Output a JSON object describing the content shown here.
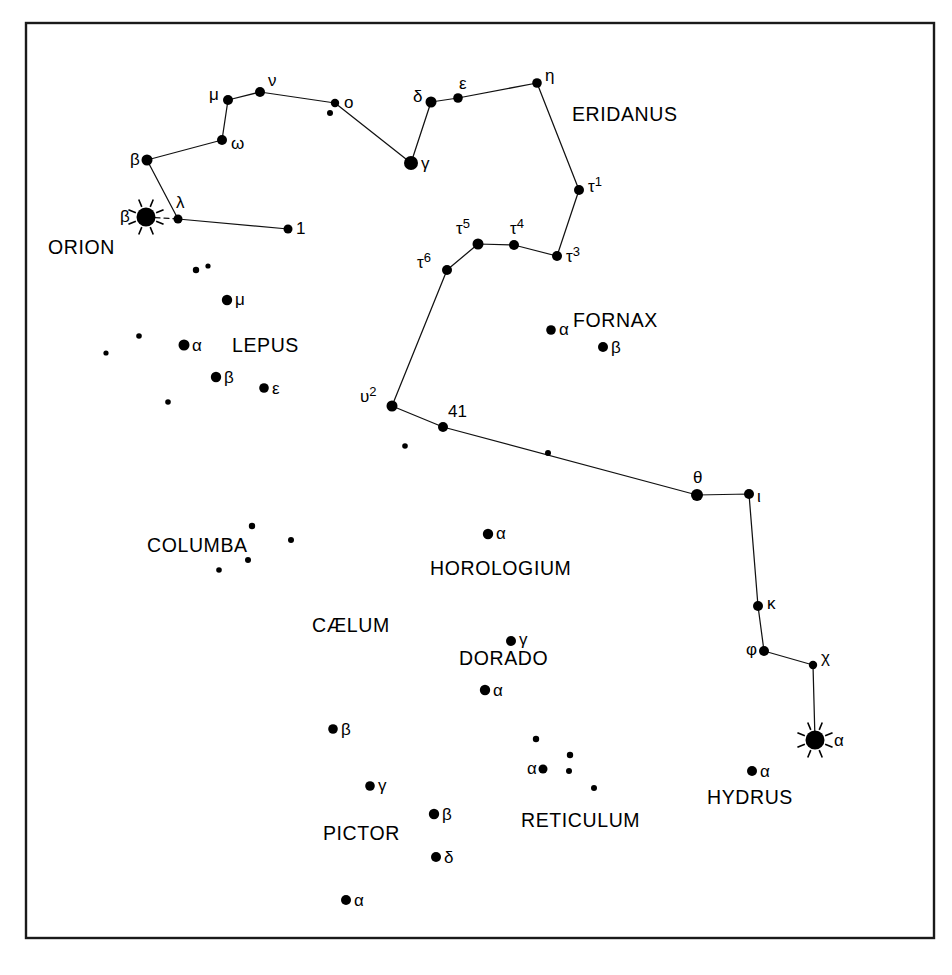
{
  "figure": {
    "background_color": "#ffffff",
    "ink_color": "#000000",
    "frame": {
      "x": 26,
      "y": 23,
      "width": 908,
      "height": 915
    }
  },
  "chart_data": {
    "type": "scatter",
    "xlabel": "",
    "ylabel": "",
    "grid": false,
    "legend": "none",
    "xlim": [
      0,
      952
    ],
    "ylim": [
      0,
      975
    ],
    "constellation_labels": [
      {
        "name": "ERIDANUS",
        "x": 572,
        "y": 121
      },
      {
        "name": "ORION",
        "x": 48,
        "y": 254
      },
      {
        "name": "LEPUS",
        "x": 232,
        "y": 352
      },
      {
        "name": "FORNAX",
        "x": 573,
        "y": 327
      },
      {
        "name": "COLUMBA",
        "x": 147,
        "y": 552
      },
      {
        "name": "HOROLOGIUM",
        "x": 430,
        "y": 575
      },
      {
        "name": "CÆLUM",
        "x": 312,
        "y": 632
      },
      {
        "name": "DORADO",
        "x": 459,
        "y": 665
      },
      {
        "name": "PICTOR",
        "x": 323,
        "y": 840
      },
      {
        "name": "RETICULUM",
        "x": 521,
        "y": 827
      },
      {
        "name": "HYDRUS",
        "x": 707,
        "y": 804
      }
    ],
    "stars": [
      {
        "label": "β",
        "sup": "",
        "x": 147,
        "y": 160,
        "r": 5.5,
        "bright": false,
        "label_dx": -17,
        "label_dy": 5,
        "constellation": "Eridanus"
      },
      {
        "label": "ω",
        "sup": "",
        "x": 222,
        "y": 140,
        "r": 5.0,
        "bright": false,
        "label_dx": 9,
        "label_dy": 9,
        "constellation": "Eridanus"
      },
      {
        "label": "μ",
        "sup": "",
        "x": 228,
        "y": 100,
        "r": 5.0,
        "bright": false,
        "label_dx": -19,
        "label_dy": 0,
        "constellation": "Eridanus"
      },
      {
        "label": "ν",
        "sup": "",
        "x": 260,
        "y": 92,
        "r": 5.0,
        "bright": false,
        "label_dx": 8,
        "label_dy": -6,
        "constellation": "Eridanus"
      },
      {
        "label": "o",
        "sup": "",
        "x": 335,
        "y": 103,
        "r": 4.2,
        "bright": false,
        "label_dx": 9,
        "label_dy": 5,
        "constellation": "Eridanus"
      },
      {
        "label": "",
        "sup": "",
        "x": 330,
        "y": 113,
        "r": 3.0,
        "bright": false,
        "label_dx": 0,
        "label_dy": 0,
        "constellation": "Eridanus"
      },
      {
        "label": "γ",
        "sup": "",
        "x": 411,
        "y": 163,
        "r": 7.0,
        "bright": false,
        "label_dx": 10,
        "label_dy": 6,
        "constellation": "Eridanus"
      },
      {
        "label": "δ",
        "sup": "",
        "x": 431,
        "y": 102,
        "r": 5.5,
        "bright": false,
        "label_dx": -18,
        "label_dy": 0,
        "constellation": "Eridanus"
      },
      {
        "label": "ε",
        "sup": "",
        "x": 458,
        "y": 98,
        "r": 4.8,
        "bright": false,
        "label_dx": 1,
        "label_dy": -9,
        "constellation": "Eridanus"
      },
      {
        "label": "η",
        "sup": "",
        "x": 537,
        "y": 83,
        "r": 4.8,
        "bright": false,
        "label_dx": 8,
        "label_dy": -2,
        "constellation": "Eridanus"
      },
      {
        "label": "τ",
        "sup": "1",
        "x": 579,
        "y": 190,
        "r": 5.0,
        "bright": false,
        "label_dx": 9,
        "label_dy": 2,
        "constellation": "Eridanus"
      },
      {
        "label": "τ",
        "sup": "3",
        "x": 557,
        "y": 256,
        "r": 5.0,
        "bright": false,
        "label_dx": 9,
        "label_dy": 6,
        "constellation": "Eridanus"
      },
      {
        "label": "τ",
        "sup": "4",
        "x": 514,
        "y": 245,
        "r": 5.0,
        "bright": false,
        "label_dx": -4,
        "label_dy": -11,
        "constellation": "Eridanus"
      },
      {
        "label": "τ",
        "sup": "5",
        "x": 478,
        "y": 244,
        "r": 5.5,
        "bright": false,
        "label_dx": -22,
        "label_dy": -10,
        "constellation": "Eridanus"
      },
      {
        "label": "τ",
        "sup": "6",
        "x": 447,
        "y": 270,
        "r": 5.0,
        "bright": false,
        "label_dx": -30,
        "label_dy": -2,
        "constellation": "Eridanus"
      },
      {
        "label": "υ",
        "sup": "2",
        "x": 392,
        "y": 406,
        "r": 5.5,
        "bright": false,
        "label_dx": -32,
        "label_dy": -4,
        "constellation": "Eridanus"
      },
      {
        "label": "41",
        "sup": "",
        "x": 443,
        "y": 427,
        "r": 5.0,
        "bright": false,
        "label_dx": 5,
        "label_dy": -10,
        "constellation": "Eridanus"
      },
      {
        "label": "",
        "sup": "",
        "x": 548,
        "y": 453,
        "r": 3.0,
        "bright": false,
        "label_dx": 0,
        "label_dy": 0,
        "constellation": "Eridanus"
      },
      {
        "label": "θ",
        "sup": "",
        "x": 697,
        "y": 495,
        "r": 6.0,
        "bright": false,
        "label_dx": -4,
        "label_dy": -12,
        "constellation": "Eridanus"
      },
      {
        "label": "ι",
        "sup": "",
        "x": 749,
        "y": 494,
        "r": 5.0,
        "bright": false,
        "label_dx": 8,
        "label_dy": 8,
        "constellation": "Eridanus"
      },
      {
        "label": "κ",
        "sup": "",
        "x": 758,
        "y": 606,
        "r": 5.0,
        "bright": false,
        "label_dx": 9,
        "label_dy": 3,
        "constellation": "Eridanus"
      },
      {
        "label": "φ",
        "sup": "",
        "x": 764,
        "y": 651,
        "r": 5.0,
        "bright": false,
        "label_dx": -18,
        "label_dy": 4,
        "constellation": "Eridanus"
      },
      {
        "label": "χ",
        "sup": "",
        "x": 813,
        "y": 665,
        "r": 4.2,
        "bright": false,
        "label_dx": 8,
        "label_dy": -2,
        "constellation": "Eridanus"
      },
      {
        "label": "α",
        "sup": "",
        "x": 815,
        "y": 740,
        "r": 9.5,
        "bright": true,
        "label_dx": 19,
        "label_dy": 6,
        "constellation": "Eridanus"
      },
      {
        "label": "1",
        "sup": "",
        "x": 288,
        "y": 229,
        "r": 4.5,
        "bright": false,
        "label_dx": 8,
        "label_dy": 5,
        "constellation": "Eridanus"
      },
      {
        "label": "λ",
        "sup": "",
        "x": 178,
        "y": 219,
        "r": 4.5,
        "bright": false,
        "label_dx": -2,
        "label_dy": -11,
        "constellation": "Orion"
      },
      {
        "label": "β",
        "sup": "",
        "x": 146,
        "y": 217,
        "r": 9.5,
        "bright": true,
        "label_dx": -26,
        "label_dy": 5,
        "constellation": "Orion"
      },
      {
        "label": "",
        "sup": "",
        "x": 196,
        "y": 270,
        "r": 3.2,
        "bright": false,
        "label_dx": 0,
        "label_dy": 0,
        "constellation": "Lepus"
      },
      {
        "label": "",
        "sup": "",
        "x": 208,
        "y": 266,
        "r": 2.6,
        "bright": false,
        "label_dx": 0,
        "label_dy": 0,
        "constellation": "Lepus"
      },
      {
        "label": "μ",
        "sup": "",
        "x": 227,
        "y": 300,
        "r": 5.2,
        "bright": false,
        "label_dx": 8,
        "label_dy": 5,
        "constellation": "Lepus"
      },
      {
        "label": "α",
        "sup": "",
        "x": 184,
        "y": 345,
        "r": 5.5,
        "bright": false,
        "label_dx": 8,
        "label_dy": 6,
        "constellation": "Lepus"
      },
      {
        "label": "",
        "sup": "",
        "x": 139,
        "y": 336,
        "r": 2.8,
        "bright": false,
        "label_dx": 0,
        "label_dy": 0,
        "constellation": "Lepus"
      },
      {
        "label": "",
        "sup": "",
        "x": 106,
        "y": 353,
        "r": 2.6,
        "bright": false,
        "label_dx": 0,
        "label_dy": 0,
        "constellation": "Lepus"
      },
      {
        "label": "β",
        "sup": "",
        "x": 216,
        "y": 377,
        "r": 5.2,
        "bright": false,
        "label_dx": 8,
        "label_dy": 6,
        "constellation": "Lepus"
      },
      {
        "label": "ε",
        "sup": "",
        "x": 264,
        "y": 388,
        "r": 4.8,
        "bright": false,
        "label_dx": 8,
        "label_dy": 6,
        "constellation": "Lepus"
      },
      {
        "label": "",
        "sup": "",
        "x": 168,
        "y": 402,
        "r": 2.8,
        "bright": false,
        "label_dx": 0,
        "label_dy": 0,
        "constellation": "Lepus"
      },
      {
        "label": "α",
        "sup": "",
        "x": 551,
        "y": 330,
        "r": 4.8,
        "bright": false,
        "label_dx": 8,
        "label_dy": 5,
        "constellation": "Fornax"
      },
      {
        "label": "β",
        "sup": "",
        "x": 603,
        "y": 347,
        "r": 5.0,
        "bright": false,
        "label_dx": 8,
        "label_dy": 6,
        "constellation": "Fornax"
      },
      {
        "label": "",
        "sup": "",
        "x": 405,
        "y": 446,
        "r": 2.8,
        "bright": false,
        "label_dx": 0,
        "label_dy": 0,
        "constellation": "Fornax"
      },
      {
        "label": "",
        "sup": "",
        "x": 252,
        "y": 526,
        "r": 3.2,
        "bright": false,
        "label_dx": 0,
        "label_dy": 0,
        "constellation": "Columba"
      },
      {
        "label": "",
        "sup": "",
        "x": 291,
        "y": 540,
        "r": 3.0,
        "bright": false,
        "label_dx": 0,
        "label_dy": 0,
        "constellation": "Columba"
      },
      {
        "label": "",
        "sup": "",
        "x": 248,
        "y": 560,
        "r": 3.0,
        "bright": false,
        "label_dx": 0,
        "label_dy": 0,
        "constellation": "Columba"
      },
      {
        "label": "",
        "sup": "",
        "x": 219,
        "y": 570,
        "r": 2.8,
        "bright": false,
        "label_dx": 0,
        "label_dy": 0,
        "constellation": "Columba"
      },
      {
        "label": "α",
        "sup": "",
        "x": 488,
        "y": 534,
        "r": 5.2,
        "bright": false,
        "label_dx": 8,
        "label_dy": 5,
        "constellation": "Horologium"
      },
      {
        "label": "γ",
        "sup": "",
        "x": 511,
        "y": 641,
        "r": 5.0,
        "bright": false,
        "label_dx": 8,
        "label_dy": 4,
        "constellation": "Dorado"
      },
      {
        "label": "α",
        "sup": "",
        "x": 485,
        "y": 690,
        "r": 5.2,
        "bright": false,
        "label_dx": 8,
        "label_dy": 6,
        "constellation": "Dorado"
      },
      {
        "label": "β",
        "sup": "",
        "x": 333,
        "y": 729,
        "r": 4.8,
        "bright": false,
        "label_dx": 8,
        "label_dy": 6,
        "constellation": "Pictor"
      },
      {
        "label": "γ",
        "sup": "",
        "x": 370,
        "y": 786,
        "r": 4.8,
        "bright": false,
        "label_dx": 8,
        "label_dy": 5,
        "constellation": "Pictor"
      },
      {
        "label": "β",
        "sup": "",
        "x": 434,
        "y": 814,
        "r": 5.2,
        "bright": false,
        "label_dx": 8,
        "label_dy": 6,
        "constellation": "Pictor"
      },
      {
        "label": "δ",
        "sup": "",
        "x": 436,
        "y": 857,
        "r": 5.0,
        "bright": false,
        "label_dx": 8,
        "label_dy": 6,
        "constellation": "Pictor"
      },
      {
        "label": "α",
        "sup": "",
        "x": 346,
        "y": 900,
        "r": 5.0,
        "bright": false,
        "label_dx": 8,
        "label_dy": 6,
        "constellation": "Pictor"
      },
      {
        "label": "",
        "sup": "",
        "x": 536,
        "y": 739,
        "r": 3.2,
        "bright": false,
        "label_dx": 0,
        "label_dy": 0,
        "constellation": "Reticulum"
      },
      {
        "label": "",
        "sup": "",
        "x": 570,
        "y": 755,
        "r": 3.2,
        "bright": false,
        "label_dx": 0,
        "label_dy": 0,
        "constellation": "Reticulum"
      },
      {
        "label": "α",
        "sup": "",
        "x": 543,
        "y": 769,
        "r": 4.5,
        "bright": false,
        "label_dx": -16,
        "label_dy": 5,
        "constellation": "Reticulum"
      },
      {
        "label": "",
        "sup": "",
        "x": 569,
        "y": 771,
        "r": 3.0,
        "bright": false,
        "label_dx": 0,
        "label_dy": 0,
        "constellation": "Reticulum"
      },
      {
        "label": "",
        "sup": "",
        "x": 594,
        "y": 788,
        "r": 3.0,
        "bright": false,
        "label_dx": 0,
        "label_dy": 0,
        "constellation": "Reticulum"
      },
      {
        "label": "α",
        "sup": "",
        "x": 752,
        "y": 771,
        "r": 5.0,
        "bright": false,
        "label_dx": 8,
        "label_dy": 6,
        "constellation": "Hydrus"
      }
    ],
    "constellation_lines": [
      {
        "constellation": "Eridanus",
        "points": [
          [
            147,
            160
          ],
          [
            222,
            140
          ],
          [
            228,
            100
          ],
          [
            260,
            92
          ],
          [
            335,
            103
          ],
          [
            411,
            163
          ],
          [
            431,
            102
          ],
          [
            458,
            98
          ],
          [
            537,
            83
          ],
          [
            579,
            190
          ],
          [
            557,
            256
          ],
          [
            514,
            245
          ],
          [
            478,
            244
          ],
          [
            447,
            270
          ],
          [
            392,
            406
          ],
          [
            443,
            427
          ],
          [
            697,
            495
          ],
          [
            749,
            494
          ],
          [
            758,
            606
          ],
          [
            764,
            651
          ],
          [
            813,
            665
          ],
          [
            815,
            740
          ]
        ]
      },
      {
        "constellation": "Eridanus",
        "points": [
          [
            147,
            160
          ],
          [
            178,
            219
          ],
          [
            288,
            229
          ]
        ]
      },
      {
        "constellation": "Orion",
        "points": [
          [
            146,
            217
          ],
          [
            178,
            219
          ]
        ],
        "style": "dashed"
      }
    ]
  }
}
